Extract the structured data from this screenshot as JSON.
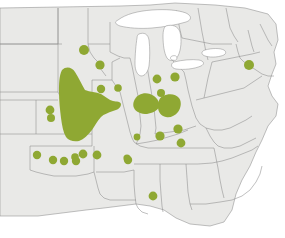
{
  "figure": {
    "title": "",
    "caption": "",
    "kind": "species-distribution-map",
    "region": "Central and Eastern United States"
  },
  "colors": {
    "range_green": "#8fa833",
    "land_fill": "#e9e9e7",
    "border_stroke": "#8b8b8b",
    "water_fill": "#ffffff",
    "background": "#ffffff"
  },
  "legend": {
    "items": [
      {
        "label": "",
        "symbol": "filled-area",
        "color": "#8fa833"
      },
      {
        "label": "",
        "symbol": "filled-dot",
        "color": "#8fa833"
      }
    ]
  },
  "map_data": {
    "type": "distribution",
    "projection": "flat-geographic",
    "viewbox": [
      0,
      0,
      285,
      238
    ],
    "core_range_areas": [
      {
        "name": "great-plains-core",
        "region": "eastern Nebraska / eastern Kansas",
        "path": "M62,70 C66,66 72,67 75,72 C79,78 82,85 85,90 C90,92 96,92 101,94 C106,97 109,100 113,101 C117,102 120,101 121,104 C121,108 117,110 113,111 C108,113 104,114 101,117 C97,121 95,126 92,130 C88,135 84,139 79,141 C74,142 69,141 66,137 C63,132 62,125 61,118 C60,110 59,101 59,92 C59,84 59,76 62,70 Z"
      },
      {
        "name": "illinois-indiana-core",
        "region": "southern Illinois / Indiana",
        "path": "M139,95 C144,92 150,93 154,96 C158,99 160,103 159,107 C157,111 152,113 147,114 C141,114 136,112 134,108 C132,104 134,98 139,95 Z"
      },
      {
        "name": "indiana-ohio-core",
        "region": "southern Indiana / southwest Ohio",
        "path": "M163,96 C169,93 176,94 179,98 C182,102 181,108 178,112 C175,116 170,118 166,117 C161,116 158,112 158,107 C158,102 159,98 163,96 Z"
      }
    ],
    "occurrence_dots": [
      {
        "id": 1,
        "region": "southern Minnesota",
        "cx": 84,
        "cy": 50,
        "r": 5.0
      },
      {
        "id": 2,
        "region": "northeast Iowa",
        "cx": 100,
        "cy": 65,
        "r": 4.6
      },
      {
        "id": 3,
        "region": "eastern Iowa",
        "cx": 101,
        "cy": 89,
        "r": 4.2
      },
      {
        "id": 4,
        "region": "northwest Illinois",
        "cx": 118,
        "cy": 88,
        "r": 3.8
      },
      {
        "id": 5,
        "region": "northern Indiana",
        "cx": 157,
        "cy": 79,
        "r": 4.4
      },
      {
        "id": 6,
        "region": "northwest Ohio",
        "cx": 175,
        "cy": 77,
        "r": 4.6
      },
      {
        "id": 7,
        "region": "central Indiana",
        "cx": 161,
        "cy": 93,
        "r": 4.0
      },
      {
        "id": 8,
        "region": "eastern Pennsylvania",
        "cx": 249,
        "cy": 65,
        "r": 5.0
      },
      {
        "id": 9,
        "region": "west-central Kansas",
        "cx": 50,
        "cy": 110,
        "r": 4.4
      },
      {
        "id": 10,
        "region": "southwest Kansas",
        "cx": 51,
        "cy": 118,
        "r": 4.0
      },
      {
        "id": 11,
        "region": "east-central Missouri",
        "cx": 137,
        "cy": 137,
        "r": 3.4
      },
      {
        "id": 12,
        "region": "western Kentucky",
        "cx": 160,
        "cy": 136,
        "r": 4.6
      },
      {
        "id": 13,
        "region": "central Kentucky",
        "cx": 178,
        "cy": 129,
        "r": 4.6
      },
      {
        "id": 14,
        "region": "central Tennessee",
        "cx": 181,
        "cy": 143,
        "r": 4.4
      },
      {
        "id": 15,
        "region": "southeast Missouri",
        "cx": 128,
        "cy": 160,
        "r": 4.2
      },
      {
        "id": 16,
        "region": "western Tennessee",
        "cx": 127,
        "cy": 158,
        "r": 3.6
      },
      {
        "id": 17,
        "region": "western Oklahoma",
        "cx": 37,
        "cy": 155,
        "r": 4.2
      },
      {
        "id": 18,
        "region": "west-central Oklahoma",
        "cx": 53,
        "cy": 160,
        "r": 4.2
      },
      {
        "id": 19,
        "region": "central Oklahoma",
        "cx": 64,
        "cy": 161,
        "r": 4.2
      },
      {
        "id": 20,
        "region": "central-east Oklahoma",
        "cx": 76,
        "cy": 161,
        "r": 4.2
      },
      {
        "id": 21,
        "region": "northeast Oklahoma",
        "cx": 83,
        "cy": 154,
        "r": 4.4
      },
      {
        "id": 22,
        "region": "southwest Missouri",
        "cx": 97,
        "cy": 155,
        "r": 4.4
      },
      {
        "id": 23,
        "region": "northwest Arkansas",
        "cx": 75,
        "cy": 157,
        "r": 3.8
      },
      {
        "id": 24,
        "region": "southern Mississippi",
        "cx": 153,
        "cy": 196,
        "r": 4.4
      }
    ],
    "state_outlines_note": "Light gray state boundaries over pale gray land; Great Lakes unfilled white"
  }
}
